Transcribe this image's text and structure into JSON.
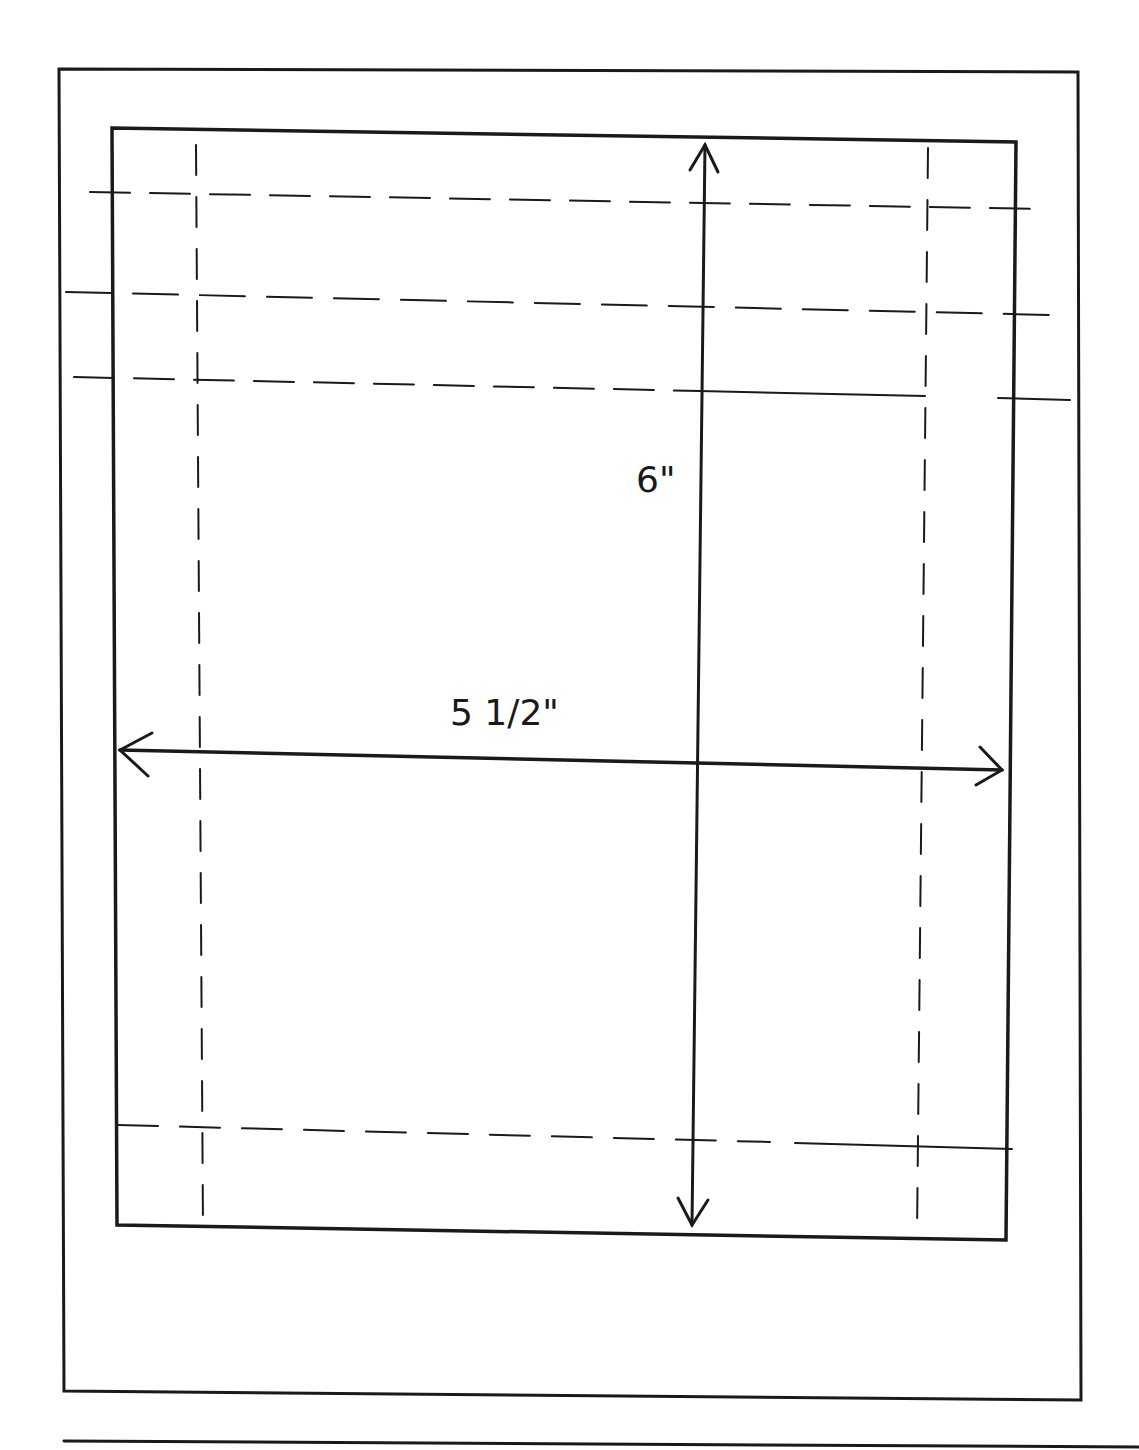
{
  "diagram": {
    "type": "dimensioned layout sketch",
    "dimensions": {
      "height_label": "6\"",
      "width_label": "5 1/2\""
    },
    "colors": {
      "ink": "#1a1a1a",
      "paper": "#ffffff"
    }
  }
}
